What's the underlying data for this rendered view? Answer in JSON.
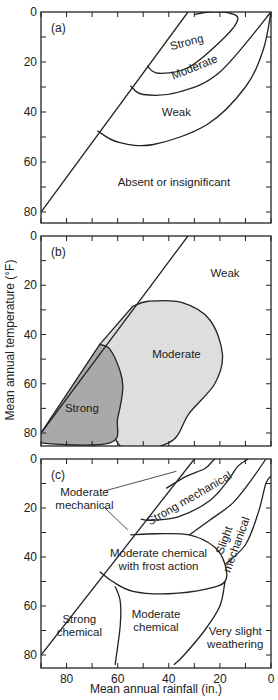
{
  "chart_data": {
    "type": "area",
    "ylabel": "Mean annual temperature (°F)",
    "xlabel": "Mean annual rainfall (in.)",
    "x_axis": {
      "range": [
        90,
        0
      ],
      "ticks": [
        80,
        60,
        40,
        20,
        0
      ],
      "reversed": true
    },
    "y_axis": {
      "range": [
        0,
        84
      ],
      "ticks": [
        0,
        20,
        40,
        60,
        80
      ],
      "inverted": true
    },
    "colors": {
      "line": "#222222",
      "strong_fill": "#a9a9a9",
      "moderate_fill": "#dedede"
    },
    "panels": [
      {
        "id": "a",
        "label": "(a)",
        "boundary_line": [
          [
            90,
            80
          ],
          [
            32.5,
            0
          ]
        ],
        "curves": [
          {
            "name": "strong-boundary",
            "points": [
              [
                48.5,
                21.5
              ],
              [
                44,
                24.5
              ],
              [
                32,
                22
              ],
              [
                18,
                10
              ],
              [
                13,
                3
              ],
              [
                16,
                0.5
              ],
              [
                24,
                0
              ],
              [
                30,
                1
              ]
            ]
          },
          {
            "name": "moderate-boundary",
            "points": [
              [
                55,
                29.5
              ],
              [
                50,
                33
              ],
              [
                36,
                32
              ],
              [
                20,
                24
              ],
              [
                0,
                0
              ]
            ]
          },
          {
            "name": "weak-boundary",
            "points": [
              [
                68,
                47.5
              ],
              [
                60,
                52
              ],
              [
                46,
                53
              ],
              [
                25,
                45
              ],
              [
                10,
                30
              ],
              [
                3,
                15
              ],
              [
                0,
                0
              ]
            ]
          }
        ],
        "regions": [
          {
            "label": "Strong",
            "at": [
              33,
              12
            ],
            "rotate": -15
          },
          {
            "label": "Moderate",
            "at": [
              30,
              22
            ],
            "rotate": -22
          },
          {
            "label": "Weak",
            "at": [
              37,
              40
            ]
          },
          {
            "label": "Absent or insignificant",
            "at": [
              38,
              68
            ]
          }
        ]
      },
      {
        "id": "b",
        "label": "(b)",
        "boundary_line": [
          [
            90,
            80
          ],
          [
            32.5,
            0
          ]
        ],
        "regions": [
          {
            "label": "Weak",
            "at": [
              18,
              15
            ]
          },
          {
            "label": "Moderate",
            "at": [
              37,
              48
            ],
            "shade": "moderate",
            "outline": [
              [
                54,
                28.5
              ],
              [
                48,
                26.5
              ],
              [
                35,
                27
              ],
              [
                24,
                34
              ],
              [
                19,
                48
              ],
              [
                22,
                60
              ],
              [
                32,
                72
              ],
              [
                40,
                84
              ],
              [
                60,
                84
              ],
              [
                67,
                44
              ]
            ]
          },
          {
            "label": "Strong",
            "at": [
              74,
              70
            ],
            "shade": "strong",
            "outline": [
              [
                67,
                44
              ],
              [
                63,
                46
              ],
              [
                59,
                55
              ],
              [
                58,
                62
              ],
              [
                60,
                74
              ],
              [
                63,
                84
              ],
              [
                90,
                84
              ],
              [
                90,
                80
              ]
            ]
          }
        ]
      },
      {
        "id": "c",
        "label": "(c)",
        "boundary_line": [
          [
            90,
            80
          ],
          [
            30,
            0
          ]
        ],
        "curves": [
          {
            "name": "strong-mechanical-boundary",
            "points": [
              [
                51,
                24.5
              ],
              [
                47,
                25
              ],
              [
                36,
                23.5
              ],
              [
                24,
                17
              ],
              [
                17,
                9
              ],
              [
                13,
                3
              ],
              [
                9,
                0
              ]
            ]
          },
          {
            "name": "strong-mechanical-upper",
            "points": [
              [
                41,
                12
              ],
              [
                33,
                7
              ],
              [
                26,
                4
              ],
              [
                23,
                1
              ],
              [
                22,
                0
              ]
            ]
          },
          {
            "name": "slight-mechanical-boundary-1",
            "points": [
              [
                32,
                31
              ],
              [
                24,
                25
              ],
              [
                15,
                18
              ],
              [
                8,
                9
              ],
              [
                2,
                0
              ]
            ]
          },
          {
            "name": "slight-mechanical-boundary-2",
            "points": [
              [
                18,
                43
              ],
              [
                10,
                35
              ],
              [
                5,
                22
              ],
              [
                2,
                10
              ],
              [
                0,
                7
              ]
            ]
          },
          {
            "name": "frost-action-boundary",
            "points": [
              [
                55,
                31
              ],
              [
                45,
                30.5
              ],
              [
                32,
                31
              ],
              [
                22,
                36
              ],
              [
                18,
                43
              ],
              [
                18,
                50
              ],
              [
                25,
                53
              ],
              [
                40,
                55
              ],
              [
                54,
                54
              ],
              [
                62,
                50
              ],
              [
                67,
                46
              ]
            ]
          },
          {
            "name": "strong-chemical-boundary",
            "points": [
              [
                61,
                52
              ],
              [
                59,
                58
              ],
              [
                59,
                68
              ],
              [
                61,
                84
              ]
            ]
          },
          {
            "name": "very-slight-boundary",
            "points": [
              [
                18,
                50
              ],
              [
                20,
                60
              ],
              [
                26,
                70
              ],
              [
                34,
                80
              ],
              [
                38,
                84
              ]
            ]
          }
        ],
        "regions": [
          {
            "label": "Moderate\nmechanical",
            "at": [
              73,
              16
            ]
          },
          {
            "label": "Strong mechanical",
            "at": [
              32,
              16
            ],
            "rotate": -30
          },
          {
            "label": "Slight\nmechanical",
            "at": [
              16,
              34
            ],
            "rotate": -70
          },
          {
            "label": "Moderate chemical\nwith frost action",
            "at": [
              44,
              41
            ]
          },
          {
            "label": "Strong\nchemical",
            "at": [
              75,
              68
            ]
          },
          {
            "label": "Moderate\nchemical",
            "at": [
              45,
              66
            ]
          },
          {
            "label": "Very slight\nweathering",
            "at": [
              14,
              73
            ]
          }
        ],
        "leaders": [
          {
            "from": [
              65,
              13
            ],
            "to": [
              37,
              5
            ]
          },
          {
            "from": [
              66,
              19
            ],
            "to": [
              56,
              29
            ]
          }
        ]
      }
    ]
  }
}
